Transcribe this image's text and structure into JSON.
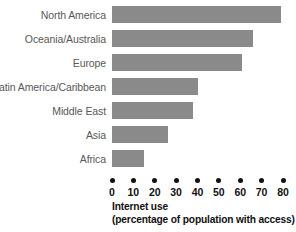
{
  "chart_data": {
    "type": "bar",
    "orientation": "horizontal",
    "title": "",
    "xlabel": "Internet use (percentage of population with access)",
    "ylabel": "",
    "xlim": [
      0,
      80
    ],
    "grid": false,
    "legend": "none",
    "categories": [
      "North America",
      "Oceania/Australia",
      "Europe",
      "Latin America/Caribbean",
      "Middle East",
      "Asia",
      "Africa"
    ],
    "values": [
      79,
      66,
      61,
      40,
      38,
      26,
      15
    ],
    "xticks": [
      0,
      10,
      20,
      30,
      40,
      50,
      60,
      70,
      80
    ],
    "bar_color": "#8a8a8a",
    "axis_color": "#111111",
    "label_color": "#585858"
  },
  "axis_title": {
    "line1": "Internet use",
    "line2": "(percentage of population with access)"
  }
}
